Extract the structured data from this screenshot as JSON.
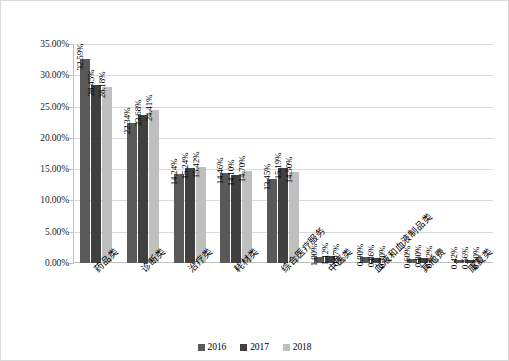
{
  "chart_data": {
    "type": "bar",
    "title": "",
    "subtitle": "",
    "xlabel": "",
    "ylabel": "",
    "ylim": [
      0,
      35
    ],
    "ytick_labels": [
      "0.00%",
      "5.00%",
      "10.00%",
      "15.00%",
      "20.00%",
      "25.00%",
      "30.00%",
      "35.00%"
    ],
    "ytick_values": [
      0,
      5,
      10,
      15,
      20,
      25,
      30,
      35
    ],
    "grid": true,
    "legend_position": "bottom-center",
    "value_suffix": "%",
    "categories": [
      "药品类",
      "诊断类",
      "治疗类",
      "耗材类",
      "综合医疗服务",
      "中医类",
      "血液和血液制品类",
      "其他费",
      "康复类"
    ],
    "series": [
      {
        "name": "2016",
        "color": "#595959",
        "values": [
          32.59,
          22.34,
          14.24,
          14.46,
          13.45,
          1.0,
          0.9,
          0.6,
          0.42
        ],
        "labels": [
          "32.59%",
          "22.34%",
          "14.24%",
          "14.46%",
          "13.45%",
          "1.00%",
          "0.90%",
          "0.60%",
          "0.42%"
        ]
      },
      {
        "name": "2017",
        "color": "#404040",
        "values": [
          28.45,
          23.68,
          15.24,
          14.1,
          15.19,
          1.12,
          0.86,
          0.8,
          0.56
        ],
        "labels": [
          "28.45%",
          "23.68%",
          "15.24%",
          "14.10%",
          "15.19%",
          "1.12%",
          "0.86%",
          "0.80%",
          "0.56%"
        ]
      },
      {
        "name": "2018",
        "color": "#bfbfbf",
        "values": [
          28.18,
          24.41,
          15.42,
          14.7,
          14.5,
          0.97,
          0.7,
          0.62,
          0.5
        ],
        "labels": [
          "28.18%",
          "24.41%",
          "15.42%",
          "14.70%",
          "14.50%",
          "0.97%",
          "0.70%",
          "0.62%",
          "0.50%"
        ]
      }
    ]
  }
}
